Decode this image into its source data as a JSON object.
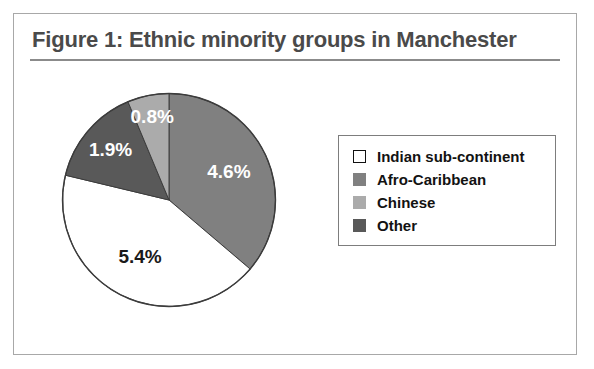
{
  "figure": {
    "title": "Figure 1: Ethnic minority groups in Manchester",
    "title_color": "#4a4a4a",
    "frame_border_color": "#a8a8a8",
    "rule_color": "#8b8b8b"
  },
  "legend": {
    "position": "right",
    "border_color": "#7d7d7d",
    "items": [
      {
        "label": "Indian sub-continent",
        "color": "#ffffff",
        "border": "#111111"
      },
      {
        "label": "Afro-Caribbean",
        "color": "#808080",
        "border": "#808080"
      },
      {
        "label": "Chinese",
        "color": "#ababab",
        "border": "#ababab"
      },
      {
        "label": "Other",
        "color": "#595959",
        "border": "#595959"
      }
    ]
  },
  "chart_data": {
    "type": "pie",
    "title": "Figure 1: Ethnic minority groups in Manchester",
    "xlabel": "",
    "ylabel": "",
    "units": "percent of population",
    "start_angle_deg": 0,
    "direction": "clockwise",
    "outline_color": "#3c3c3c",
    "labels": [
      "Afro-Caribbean",
      "Indian sub-continent",
      "Other",
      "Chinese"
    ],
    "values": [
      4.6,
      5.4,
      1.9,
      0.8
    ],
    "value_labels": [
      "4.6%",
      "5.4%",
      "1.9%",
      "0.8%"
    ],
    "colors": [
      "#808080",
      "#ffffff",
      "#595959",
      "#ababab"
    ],
    "label_text_colors": [
      "light",
      "dark",
      "light",
      "light"
    ],
    "total": 12.7,
    "legend_order": [
      "Indian sub-continent",
      "Afro-Caribbean",
      "Chinese",
      "Other"
    ]
  }
}
